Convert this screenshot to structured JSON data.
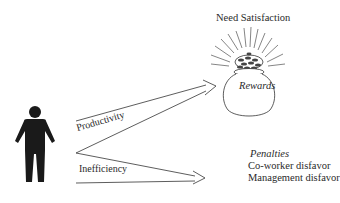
{
  "diagram": {
    "title": "Need Satisfaction",
    "rewards_label": "Rewards",
    "paths": [
      {
        "label": "Productivity",
        "target": "Rewards"
      },
      {
        "label": "Inefficiency",
        "target": "Penalties"
      }
    ],
    "penalties": {
      "title": "Penalties",
      "items": [
        "Co-worker disfavor",
        "Management disfavor"
      ]
    },
    "icons": [
      "person-icon",
      "pot-of-gold-icon"
    ],
    "colors": {
      "ink": "#2a2a2a",
      "background": "#ffffff",
      "figure": "#1a1a1a"
    }
  }
}
